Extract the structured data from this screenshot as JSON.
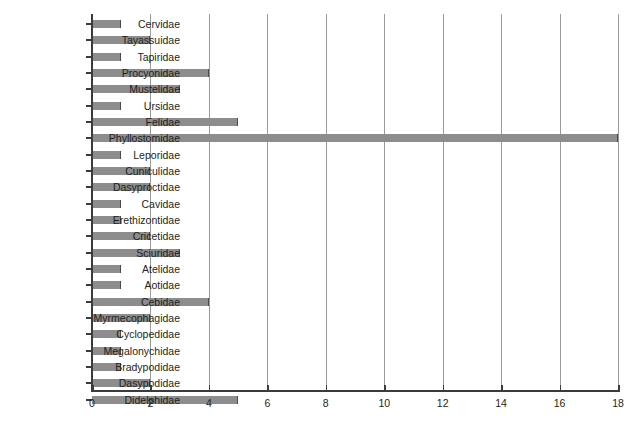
{
  "chart_data": {
    "type": "bar",
    "orientation": "horizontal",
    "title": "",
    "subtitle": "",
    "xlabel": "",
    "ylabel": "",
    "xlim": [
      0,
      18
    ],
    "ylim": null,
    "grid": true,
    "gridlines_axis": "x",
    "legend": null,
    "legend_position": "none",
    "bar_color": "#8d8d8d",
    "bar_edge_color": "#4a4a4a",
    "axis_color": "#3b3b3b",
    "gridline_color": "#9a9a9a",
    "xticks": [
      0,
      2,
      4,
      6,
      8,
      10,
      12,
      14,
      16,
      18
    ],
    "xtick_labels": [
      "0",
      "2",
      "4",
      "6",
      "8",
      "10",
      "12",
      "14",
      "16",
      "18"
    ],
    "categories": [
      "Cervidae",
      "Tayassuidae",
      "Tapiridae",
      "Procyonidae",
      "Mustelidae",
      "Ursidae",
      "Felidae",
      "Phyllostomidae",
      "Leporidae",
      "Cuniculidae",
      "Dasyproctidae",
      "Cavidae",
      "Erethizontidae",
      "Cricetidae",
      "Sciuridae",
      "Atelidae",
      "Aotidae",
      "Cebidae",
      "Myrmecophagidae",
      "Cyclopedidae",
      "Megalonychidae",
      "Bradypodidae",
      "Dasypodidae",
      "Didelphidae"
    ],
    "values": [
      1,
      2,
      1,
      4,
      3,
      1,
      5,
      18,
      1,
      2,
      2,
      1,
      1,
      2,
      3,
      1,
      1,
      4,
      2,
      1,
      1,
      1,
      2,
      5
    ]
  }
}
